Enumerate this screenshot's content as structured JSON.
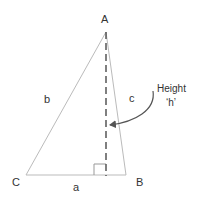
{
  "diagram": {
    "type": "triangle-altitude",
    "vertices": [
      {
        "id": "A",
        "label": "A",
        "x": 106,
        "y": 32
      },
      {
        "id": "B",
        "label": "B",
        "x": 126,
        "y": 175
      },
      {
        "id": "C",
        "label": "C",
        "x": 26,
        "y": 175
      }
    ],
    "sides": [
      {
        "id": "a",
        "label": "a",
        "from": "C",
        "to": "B"
      },
      {
        "id": "b",
        "label": "b",
        "from": "C",
        "to": "A"
      },
      {
        "id": "c",
        "label": "c",
        "from": "A",
        "to": "B"
      }
    ],
    "altitude": {
      "from": "A",
      "foot_x": 106,
      "foot_y": 175,
      "style": "dashed"
    },
    "annotation": {
      "line1": "Height",
      "line2": "‘h’"
    },
    "colors": {
      "triangle_stroke": "#bbbbbb",
      "altitude_stroke": "#555555",
      "arrow_stroke": "#555555",
      "text": "#333333"
    }
  }
}
